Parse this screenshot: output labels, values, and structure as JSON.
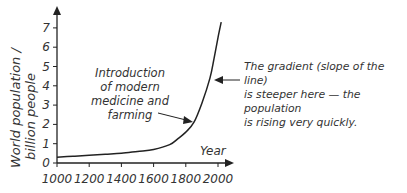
{
  "chart_data": {
    "type": "line",
    "title": "",
    "xlabel": "Year",
    "ylabel": "World population / billion people",
    "ylabel_lines": [
      "World population /",
      "billion people"
    ],
    "xlim": [
      1000,
      2050
    ],
    "ylim": [
      0,
      7.8
    ],
    "x_ticks": [
      1000,
      1200,
      1400,
      1600,
      1800,
      2000
    ],
    "y_ticks": [
      0,
      1,
      2,
      3,
      4,
      5,
      6,
      7
    ],
    "grid": false,
    "legend": null,
    "series": [
      {
        "name": "World population",
        "x": [
          1000,
          1100,
          1200,
          1300,
          1400,
          1500,
          1600,
          1700,
          1750,
          1800,
          1850,
          1900,
          1950,
          1975,
          2000,
          2020
        ],
        "values": [
          0.3,
          0.35,
          0.4,
          0.45,
          0.5,
          0.6,
          0.7,
          0.95,
          1.25,
          1.6,
          2.1,
          3.1,
          4.4,
          5.4,
          6.5,
          7.3
        ]
      }
    ],
    "annotations": [
      {
        "text_lines": [
          "Introduction",
          "of modern",
          "medicine and",
          "farming"
        ],
        "points_to": {
          "x": 1850,
          "y": 2.1
        }
      },
      {
        "text_lines": [
          "The gradient (slope of the line)",
          "is steeper here — the population",
          "is rising very quickly."
        ],
        "points_to": {
          "x": 1950,
          "y": 4.4
        }
      }
    ]
  }
}
